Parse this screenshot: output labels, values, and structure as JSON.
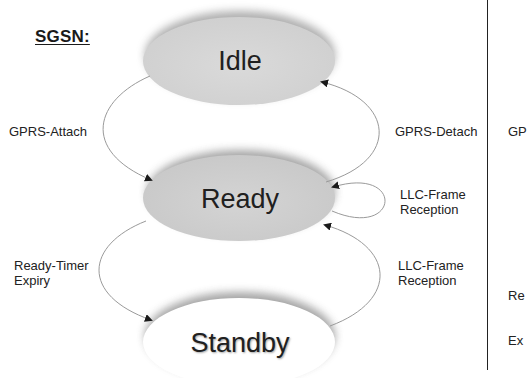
{
  "diagram": {
    "title": "SGSN:",
    "colors": {
      "idle_fill": "#d6d6d6",
      "ready_fill": "#d0d0d0",
      "standby_fill": "#ffffff",
      "shadow": "#8a8a8a",
      "edge": "#9a9a9a",
      "arrow": "#1a1a1a"
    },
    "states": [
      {
        "id": "idle",
        "label": "Idle"
      },
      {
        "id": "ready",
        "label": "Ready"
      },
      {
        "id": "standby",
        "label": "Standby"
      }
    ],
    "transitions": [
      {
        "from": "idle",
        "to": "ready",
        "label": "GPRS-Attach"
      },
      {
        "from": "ready",
        "to": "idle",
        "label": "GPRS-Detach"
      },
      {
        "from": "ready",
        "to": "ready",
        "label_line1": "LLC-Frame",
        "label_line2": "Reception"
      },
      {
        "from": "ready",
        "to": "standby",
        "label_line1": "Ready-Timer",
        "label_line2": "Expiry"
      },
      {
        "from": "standby",
        "to": "ready",
        "label_line1": "LLC-Frame",
        "label_line2": "Reception"
      }
    ],
    "cut_off_panel": {
      "label_1": "GP",
      "label_2_line1": "Re",
      "label_2_line2": "Ex"
    }
  }
}
